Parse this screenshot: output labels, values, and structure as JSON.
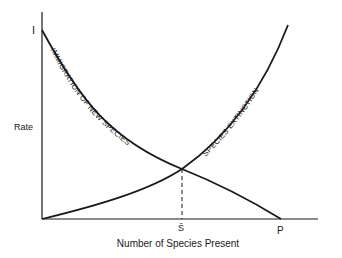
{
  "diagram": {
    "axes": {
      "y_label": "Rate",
      "x_label": "Number of Species Present",
      "y_intercept_label": "I",
      "x_intercept_label": "P",
      "equilibrium_label": "Ŝ"
    },
    "curves": [
      {
        "name": "immigration",
        "label": "IMMIGRATION OF NEW SPECIES",
        "trend": "decreasing from I to P"
      },
      {
        "name": "extinction",
        "label": "SPECIES EXTINCTION",
        "trend": "increasing from origin"
      }
    ],
    "colors": {
      "line": "#1a1a1a",
      "background": "#ffffff"
    }
  }
}
